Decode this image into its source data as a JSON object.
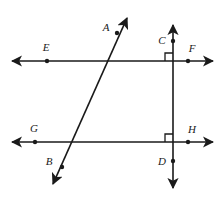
{
  "figure": {
    "stroke_color": "#1a1a1a",
    "background_color": "#ffffff",
    "labels": {
      "A": "A",
      "B": "B",
      "C": "C",
      "D": "D",
      "E": "E",
      "F": "F",
      "G": "G",
      "H": "H"
    },
    "points": [
      {
        "id": "A",
        "label": "A",
        "x": 117,
        "y": 33,
        "label_x": 106,
        "label_y": 31
      },
      {
        "id": "B",
        "label": "B",
        "x": 62,
        "y": 167,
        "label_x": 49,
        "label_y": 165
      },
      {
        "id": "C",
        "label": "C",
        "x": 173,
        "y": 41,
        "label_x": 162,
        "label_y": 39
      },
      {
        "id": "D",
        "label": "D",
        "x": 173,
        "y": 161,
        "label_x": 162,
        "label_y": 165
      },
      {
        "id": "E",
        "label": "E",
        "x": 47,
        "y": 61,
        "label_x": 43,
        "label_y": 49
      },
      {
        "id": "F",
        "label": "F",
        "x": 188,
        "y": 61,
        "label_x": 190,
        "label_y": 50
      },
      {
        "id": "G",
        "label": "G",
        "x": 35,
        "y": 142,
        "label_x": 31,
        "label_y": 131
      },
      {
        "id": "H",
        "label": "H",
        "x": 188,
        "y": 142,
        "label_x": 190,
        "label_y": 131
      }
    ],
    "lines": [
      {
        "id": "upper-horizontal-line",
        "name": "line-EF",
        "x1": 12,
        "y1": 61,
        "x2": 213,
        "y2": 61,
        "arrows": "both"
      },
      {
        "id": "lower-horizontal-line",
        "name": "line-GH",
        "x1": 12,
        "y1": 142,
        "x2": 213,
        "y2": 142,
        "arrows": "both"
      },
      {
        "id": "vertical-line",
        "name": "line-CD",
        "x1": 173,
        "y1": 25,
        "x2": 173,
        "y2": 188,
        "arrows": "both"
      },
      {
        "id": "transversal-line",
        "name": "line-AB",
        "x1": 127,
        "y1": 18,
        "x2": 53,
        "y2": 184,
        "arrows": "both"
      }
    ],
    "right_angles": [
      {
        "id": "right-angle-top",
        "vertex_x": 173,
        "vertex_y": 61,
        "dir_x": -1,
        "dir_y": -1,
        "size": 8
      },
      {
        "id": "right-angle-bottom",
        "vertex_x": 173,
        "vertex_y": 142,
        "dir_x": -1,
        "dir_y": -1,
        "size": 8
      }
    ]
  }
}
